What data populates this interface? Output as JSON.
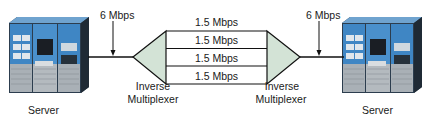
{
  "diagram": {
    "left_server": {
      "label": "Server",
      "icon": "server-icon"
    },
    "right_server": {
      "label": "Server",
      "icon": "server-icon"
    },
    "left_link": {
      "rate": "6 Mbps"
    },
    "right_link": {
      "rate": "6 Mbps"
    },
    "left_mux": {
      "label_line1": "Inverse",
      "label_line2": "Multiplexer"
    },
    "right_mux": {
      "label_line1": "Inverse",
      "label_line2": "Multiplexer"
    },
    "channels": [
      {
        "rate": "1.5 Mbps"
      },
      {
        "rate": "1.5 Mbps"
      },
      {
        "rate": "1.5 Mbps"
      },
      {
        "rate": "1.5 Mbps"
      }
    ],
    "colors": {
      "mux_fill": "#d3e3d6",
      "server_blue": "#3f86c4",
      "line": "#111111"
    }
  }
}
